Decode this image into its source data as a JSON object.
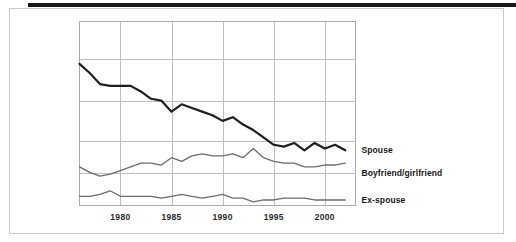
{
  "figure": {
    "background_color": "#ffffff",
    "panel_border_color": "#c9cacc",
    "top_rule_color": "#17181a",
    "grid_color": "#bdbec0",
    "frame_color": "#a9aaac"
  },
  "chart_data": {
    "type": "line",
    "title": "",
    "subtitle": "",
    "xlabel": "",
    "ylabel": "",
    "xlim": [
      1976,
      2003
    ],
    "ylim": [
      0,
      100
    ],
    "grid": true,
    "legend_position": "right-inline",
    "xticks": [
      "1980",
      "1985",
      "1990",
      "1995",
      "2000"
    ],
    "xtick_values": [
      1980,
      1985,
      1990,
      1995,
      2000
    ],
    "yticks": [],
    "x": [
      1976,
      1977,
      1978,
      1979,
      1980,
      1981,
      1982,
      1983,
      1984,
      1985,
      1986,
      1987,
      1988,
      1989,
      1990,
      1991,
      1992,
      1993,
      1994,
      1995,
      1996,
      1997,
      1998,
      1999,
      2000,
      2001,
      2002
    ],
    "series": [
      {
        "name": "Spouse",
        "color": "#1d1e20",
        "width": 2.2,
        "values": [
          77,
          72,
          66,
          65,
          65,
          65,
          62,
          58,
          57,
          51,
          55,
          53,
          51,
          49,
          46,
          48,
          44,
          41,
          37,
          33,
          32,
          34,
          30,
          34,
          31,
          33,
          30
        ]
      },
      {
        "name": "Boyfriend/girlfriend",
        "color": "#6a6c6e",
        "width": 1.3,
        "values": [
          21,
          18,
          16,
          17,
          19,
          21,
          23,
          23,
          22,
          26,
          24,
          27,
          28,
          27,
          27,
          28,
          26,
          31,
          26,
          24,
          23,
          23,
          21,
          21,
          22,
          22,
          23
        ]
      },
      {
        "name": "Ex-spouse",
        "color": "#6a6c6e",
        "width": 1.3,
        "values": [
          5,
          5,
          6,
          8,
          5,
          5,
          5,
          5,
          4,
          5,
          6,
          5,
          4,
          5,
          6,
          4,
          4,
          2,
          3,
          3,
          4,
          4,
          4,
          3,
          3,
          3,
          3
        ]
      }
    ],
    "annotations": [
      {
        "text": "Spouse",
        "series": "Spouse"
      },
      {
        "text": "Boyfriend/girlfriend",
        "series": "Boyfriend/girlfriend"
      },
      {
        "text": "Ex-spouse",
        "series": "Ex-spouse"
      }
    ]
  }
}
